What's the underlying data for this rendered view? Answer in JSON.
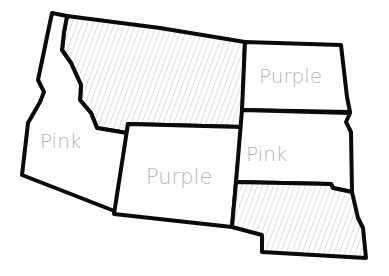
{
  "map": {
    "description": "Hand-drawn outline map of six northern plains/mountain states colored with a two-color scheme",
    "hatch_color": "#c8c8c8",
    "label_color": "#b5b5b5",
    "outline_color": "#0a0a0a",
    "regions": [
      {
        "id": "idaho",
        "label": "Pink",
        "shaded": false
      },
      {
        "id": "montana",
        "label": "",
        "shaded": true
      },
      {
        "id": "wyoming",
        "label": "Purple",
        "shaded": false
      },
      {
        "id": "north-dakota",
        "label": "Purple",
        "shaded": false
      },
      {
        "id": "south-dakota",
        "label": "Pink",
        "shaded": false
      },
      {
        "id": "nebraska",
        "label": "",
        "shaded": true
      }
    ]
  }
}
